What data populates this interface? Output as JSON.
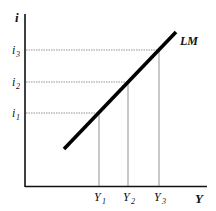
{
  "diagram": {
    "curve_label": "LM",
    "y_axis_label": "i",
    "x_axis_label": "Y",
    "y_ticks": [
      {
        "label": "i",
        "sub": "3",
        "y": 50
      },
      {
        "label": "i",
        "sub": "2",
        "y": 82
      },
      {
        "label": "i",
        "sub": "1",
        "y": 113
      }
    ],
    "x_ticks": [
      {
        "label": "Y",
        "sub": "1",
        "x": 99
      },
      {
        "label": "Y",
        "sub": "2",
        "x": 128
      },
      {
        "label": "Y",
        "sub": "3",
        "x": 159
      }
    ],
    "colors": {
      "line": "#000000",
      "guides": "#555555",
      "axis": "#111111"
    }
  }
}
